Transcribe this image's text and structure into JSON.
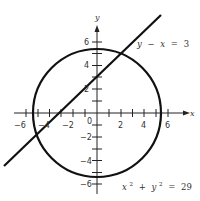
{
  "figure": {
    "axes": {
      "x_label": "x",
      "y_label": "y",
      "origin_label": "0",
      "x_tick_labels": [
        "−6",
        "−4",
        "−2",
        "2",
        "4",
        "6"
      ],
      "y_tick_labels": [
        "6",
        "4",
        "2",
        "−2",
        "−4",
        "−6"
      ]
    },
    "curves": [
      {
        "name": "circle",
        "equation_lhs_x": "x",
        "equation_lhs_y": "y",
        "exp": "2",
        "plus": "+",
        "equals": "=",
        "rhs": "29",
        "radius_sq": 29
      },
      {
        "name": "line",
        "equation": "y − x = 3",
        "y_var": "y",
        "minus": "−",
        "x_var": "x",
        "equals": "=",
        "rhs": "3"
      }
    ],
    "stroke_color": "#111111"
  }
}
